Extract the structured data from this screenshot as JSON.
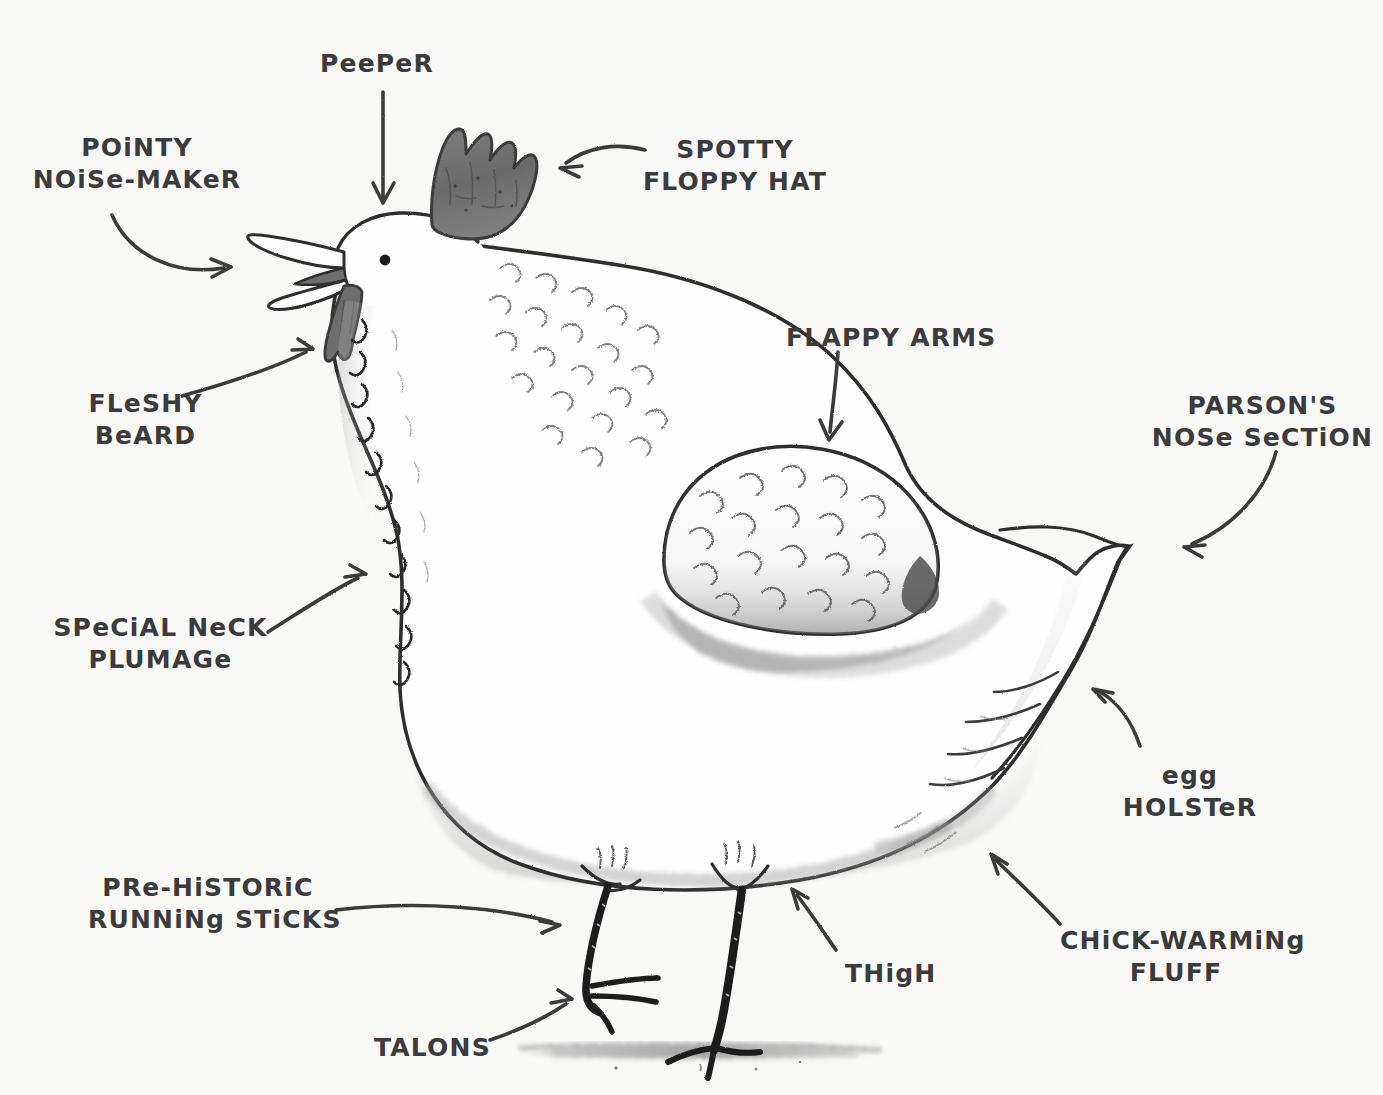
{
  "figure": {
    "kind": "hand-drawn pencil illustration",
    "background_color": "#f8f8f7",
    "ink_color": "#3b3b3b",
    "comb_color": "#6f6f6f",
    "wattle_color": "#6f6f6f",
    "shadow_color": "#9a9a9a"
  },
  "labels": [
    {
      "id": "peeper",
      "name": "peeper",
      "lines": [
        "PeePeR"
      ],
      "x": 320,
      "y": 48,
      "width": 140,
      "align": "left"
    },
    {
      "id": "pointy-noise-maker",
      "name": "pointy-noise-maker",
      "lines": [
        "POiNTY",
        "NOiSe-MAKeR"
      ],
      "x": 22,
      "y": 132,
      "width": 230,
      "align": "center"
    },
    {
      "id": "spotty-floppy-hat",
      "name": "spotty-floppy-hat",
      "lines": [
        "SPOTTY",
        "FLOPPY HAT"
      ],
      "x": 640,
      "y": 134,
      "width": 190,
      "align": "center"
    },
    {
      "id": "flappy-arms",
      "name": "flappy-arms",
      "lines": [
        "FLAPPY ARMS"
      ],
      "x": 786,
      "y": 322,
      "width": 190,
      "align": "left"
    },
    {
      "id": "parsons-nose-section",
      "name": "parsons-nose-section",
      "lines": [
        "PARSON'S",
        "NOSe SeCTiON"
      ],
      "x": 1150,
      "y": 390,
      "width": 225,
      "align": "center"
    },
    {
      "id": "fleshy-beard",
      "name": "fleshy-beard",
      "lines": [
        "FLeSHY",
        "BeARD"
      ],
      "x": 78,
      "y": 388,
      "width": 135,
      "align": "center"
    },
    {
      "id": "special-neck-plumage",
      "name": "special-neck-plumage",
      "lines": [
        "SPeCiAL NeCK",
        "PLUMAGe"
      ],
      "x": 48,
      "y": 612,
      "width": 225,
      "align": "center"
    },
    {
      "id": "egg-holster",
      "name": "egg-holster",
      "lines": [
        "egg",
        "HOLSTeR"
      ],
      "x": 1120,
      "y": 760,
      "width": 140,
      "align": "center"
    },
    {
      "id": "pre-historic-running-sticks",
      "name": "pre-historic-running-sticks",
      "lines": [
        "PRe-HiSTORiC",
        "RUNNiNg STiCKS"
      ],
      "x": 88,
      "y": 872,
      "width": 240,
      "align": "center"
    },
    {
      "id": "thigh",
      "name": "thigh",
      "lines": [
        "THigH"
      ],
      "x": 845,
      "y": 958,
      "width": 100,
      "align": "left"
    },
    {
      "id": "chick-warming-fluff",
      "name": "chick-warming-fluff",
      "lines": [
        "CHiCK-WARMiNg",
        "FLUFF"
      ],
      "x": 1060,
      "y": 925,
      "width": 232,
      "align": "center"
    },
    {
      "id": "talons",
      "name": "talons",
      "lines": [
        "TALONS"
      ],
      "x": 374,
      "y": 1032,
      "width": 110,
      "align": "left"
    }
  ],
  "arrows": [
    {
      "id": "arrow-peeper",
      "name": "arrow-to-peeper",
      "path": "M 383 92 L 383 198",
      "head": "M 383 203 L 373 183 M 383 203 L 394 183"
    },
    {
      "id": "arrow-pointy-noise-maker",
      "name": "arrow-to-beak",
      "path": "M 112 215 C 130 256, 176 276, 224 268",
      "head": "M 231 267 L 211 259 M 231 267 L 212 277"
    },
    {
      "id": "arrow-spotty-floppy-hat",
      "name": "arrow-to-comb",
      "path": "M 645 150 C 615 142, 586 148, 566 163",
      "head": "M 560 168 L 582 166 M 560 168 L 579 177"
    },
    {
      "id": "arrow-flappy-arms",
      "name": "arrow-to-wing",
      "path": "M 838 352 C 836 384, 832 410, 830 432",
      "head": "M 829 440 L 820 420 M 829 440 L 842 422"
    },
    {
      "id": "arrow-parsons-nose-section",
      "name": "arrow-to-tail",
      "path": "M 1276 452 C 1266 490, 1235 526, 1192 544",
      "head": "M 1184 547 L 1205 545 M 1184 547 L 1202 557"
    },
    {
      "id": "arrow-fleshy-beard",
      "name": "arrow-to-wattle",
      "path": "M 182 396 C 232 382, 278 366, 306 352",
      "head": "M 313 349 L 292 350 M 313 349 L 298 339"
    },
    {
      "id": "arrow-special-neck-plumage",
      "name": "arrow-to-neck",
      "path": "M 268 632 C 300 612, 332 590, 358 578",
      "head": "M 366 574 L 345 577 M 366 574 L 350 565"
    },
    {
      "id": "arrow-egg-holster",
      "name": "arrow-to-vent",
      "path": "M 1140 746 C 1132 722, 1118 702, 1100 692",
      "head": "M 1093 689 L 1113 693 M 1093 689 L 1105 702"
    },
    {
      "id": "arrow-pre-historic-running-sticks",
      "name": "arrow-to-legs",
      "path": "M 336 910 C 420 900, 500 908, 552 922",
      "head": "M 560 925 L 540 921 M 560 925 L 542 933"
    },
    {
      "id": "arrow-thigh",
      "name": "arrow-to-thigh",
      "path": "M 836 950 C 822 930, 810 912, 797 895",
      "head": "M 792 889 L 798 909 M 792 889 L 808 898"
    },
    {
      "id": "arrow-chick-warming-fluff",
      "name": "arrow-to-fluff",
      "path": "M 1060 924 C 1038 900, 1012 876, 996 860",
      "head": "M 991 854 L 998 874 M 991 854 L 1007 864"
    },
    {
      "id": "arrow-talons",
      "name": "arrow-to-talons",
      "path": "M 490 1040 C 520 1030, 548 1016, 566 1004",
      "head": "M 572 999 L 551 1003 M 572 999 L 558 990"
    }
  ],
  "bird_parts": [
    {
      "id": "comb",
      "name": "comb-spotty-floppy-hat"
    },
    {
      "id": "beak",
      "name": "beak-pointy-noise-maker"
    },
    {
      "id": "eye",
      "name": "eye-peeper"
    },
    {
      "id": "wattle",
      "name": "wattle-fleshy-beard"
    },
    {
      "id": "neck",
      "name": "neck-special-plumage"
    },
    {
      "id": "wing",
      "name": "wing-flappy-arms"
    },
    {
      "id": "tail",
      "name": "tail-parsons-nose"
    },
    {
      "id": "vent",
      "name": "vent-egg-holster"
    },
    {
      "id": "fluff",
      "name": "fluff-chick-warming"
    },
    {
      "id": "thigh",
      "name": "thigh"
    },
    {
      "id": "legs",
      "name": "legs-running-sticks"
    },
    {
      "id": "talons",
      "name": "talons"
    },
    {
      "id": "ground",
      "name": "ground-shadow"
    }
  ]
}
